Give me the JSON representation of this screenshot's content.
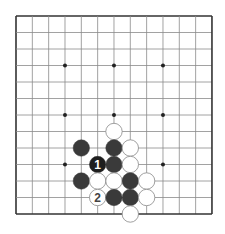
{
  "diagram": {
    "type": "go-board",
    "board_size": 13,
    "origin": {
      "x": 16,
      "y": 16
    },
    "spacing": {
      "x": 16.33,
      "y": 16.5
    },
    "colors": {
      "background": "#ffffff",
      "grid_line": "#8a8a8a",
      "border_line": "#333333",
      "black_stone": "#3a3a3a",
      "black_stone_numbered": "#1e1e1e",
      "white_stone": "#ffffff",
      "white_stone_edge": "#888888",
      "star_point": "#222222"
    },
    "star_points": [
      [
        3,
        3
      ],
      [
        6,
        3
      ],
      [
        9,
        3
      ],
      [
        3,
        6
      ],
      [
        6,
        6
      ],
      [
        9,
        6
      ],
      [
        3,
        9
      ],
      [
        6,
        9
      ],
      [
        9,
        9
      ]
    ],
    "stones": [
      {
        "col": 6,
        "row": 7,
        "color": "white",
        "label": ""
      },
      {
        "col": 4,
        "row": 8,
        "color": "black",
        "label": ""
      },
      {
        "col": 6,
        "row": 8,
        "color": "black",
        "label": ""
      },
      {
        "col": 7,
        "row": 8,
        "color": "white",
        "label": ""
      },
      {
        "col": 5,
        "row": 9,
        "color": "black",
        "label": "1"
      },
      {
        "col": 6,
        "row": 9,
        "color": "black",
        "label": ""
      },
      {
        "col": 7,
        "row": 9,
        "color": "white",
        "label": ""
      },
      {
        "col": 4,
        "row": 10,
        "color": "black",
        "label": ""
      },
      {
        "col": 5,
        "row": 10,
        "color": "white",
        "label": ""
      },
      {
        "col": 6,
        "row": 10,
        "color": "white",
        "label": ""
      },
      {
        "col": 7,
        "row": 10,
        "color": "black",
        "label": ""
      },
      {
        "col": 8,
        "row": 10,
        "color": "white",
        "label": ""
      },
      {
        "col": 5,
        "row": 11,
        "color": "white",
        "label": "2"
      },
      {
        "col": 6,
        "row": 11,
        "color": "black",
        "label": ""
      },
      {
        "col": 7,
        "row": 11,
        "color": "black",
        "label": ""
      },
      {
        "col": 8,
        "row": 11,
        "color": "white",
        "label": ""
      },
      {
        "col": 7,
        "row": 12,
        "color": "white",
        "label": ""
      }
    ],
    "move_labels": {
      "move_1": "1",
      "move_2": "2"
    }
  }
}
